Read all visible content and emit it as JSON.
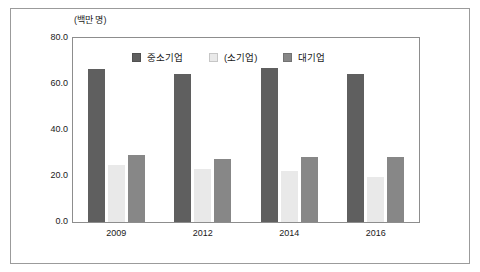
{
  "chart_data": {
    "type": "bar",
    "title": "",
    "unit_label": "(백만 명)",
    "xlabel": "",
    "ylabel": "",
    "categories": [
      "2009",
      "2012",
      "2014",
      "2016"
    ],
    "series": [
      {
        "name": "중소기업",
        "color": "#5f5f5f",
        "values": [
          66.5,
          64.5,
          67.0,
          64.5
        ]
      },
      {
        "name": "(소기업)",
        "color": "#e9e9e9",
        "values": [
          24.8,
          23.0,
          22.0,
          19.6
        ]
      },
      {
        "name": "대기업",
        "color": "#878787",
        "values": [
          29.1,
          27.3,
          28.2,
          28.3
        ]
      }
    ],
    "ylim": [
      0,
      80
    ],
    "yticks": [
      "0.0",
      "20.0",
      "40.0",
      "60.0",
      "80.0"
    ],
    "ytick_values": [
      0,
      20,
      40,
      60,
      80
    ],
    "grid": false,
    "legend_position": "top-center"
  },
  "colors": {
    "frame": "#9b9b9b",
    "plot_border": "#8d8d8d",
    "text": "#1a1a1a",
    "background": "#ffffff"
  }
}
